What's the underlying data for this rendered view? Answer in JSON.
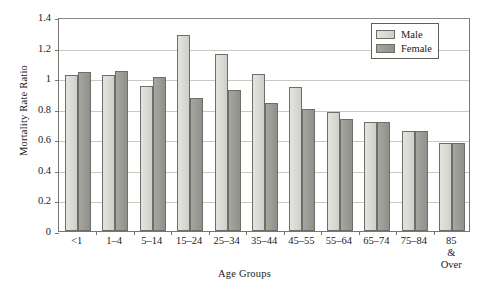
{
  "chart_data": {
    "type": "bar",
    "title": "",
    "xlabel": "Age Groups",
    "ylabel": "Mortality Rate Ratio",
    "ylim": [
      0,
      1.4
    ],
    "yticks": [
      "0",
      "0.2",
      "0.4",
      "0.6",
      "0.8",
      "1",
      "1.2",
      "1.4"
    ],
    "ytick_values": [
      0,
      0.2,
      0.4,
      0.6,
      0.8,
      1.0,
      1.2,
      1.4
    ],
    "grid": "horizontal",
    "legend_position": "top-right",
    "categories": [
      "<1",
      "1–4",
      "5–14",
      "15–24",
      "25–34",
      "35–44",
      "45–55",
      "55–64",
      "65–74",
      "75–84",
      "85 &\nOver"
    ],
    "series": [
      {
        "name": "Male",
        "color": "#dcdcd7",
        "values": [
          1.02,
          1.02,
          0.95,
          1.28,
          1.16,
          1.03,
          0.94,
          0.78,
          0.715,
          0.655,
          0.575
        ]
      },
      {
        "name": "Female",
        "color": "#9d9d98",
        "values": [
          1.04,
          1.045,
          1.01,
          0.87,
          0.925,
          0.835,
          0.8,
          0.735,
          0.715,
          0.655,
          0.575
        ]
      }
    ]
  },
  "legend": {
    "entries": [
      {
        "label": "Male"
      },
      {
        "label": "Female"
      }
    ]
  }
}
